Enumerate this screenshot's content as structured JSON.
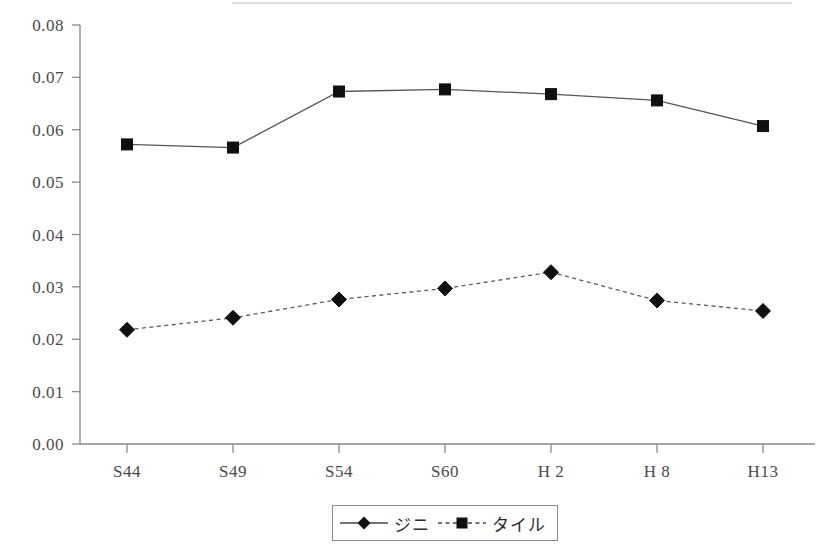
{
  "chart_data": {
    "type": "line",
    "title": "",
    "subtitle": "",
    "xlabel": "",
    "ylabel": "",
    "categories": [
      "S44",
      "S49",
      "S54",
      "S60",
      "H 2",
      "H 8",
      "H13"
    ],
    "series": [
      {
        "name": "ジニ",
        "marker": "diamond",
        "linestyle": "dashed",
        "color": "#101010",
        "values": [
          0.0218,
          0.0241,
          0.0276,
          0.0297,
          0.0328,
          0.0274,
          0.0254
        ]
      },
      {
        "name": "タイル",
        "marker": "square",
        "linestyle": "solid",
        "color": "#101010",
        "values": [
          0.0572,
          0.0566,
          0.0673,
          0.0677,
          0.0668,
          0.0656,
          0.0607
        ]
      }
    ],
    "ylim": [
      0.0,
      0.08
    ],
    "ytick_labels": [
      "0.00",
      "0.01",
      "0.02",
      "0.03",
      "0.04",
      "0.05",
      "0.06",
      "0.07",
      "0.08"
    ],
    "ytick_values": [
      0.0,
      0.01,
      0.02,
      0.03,
      0.04,
      0.05,
      0.06,
      0.07,
      0.08
    ],
    "grid": false,
    "legend_position": "bottom-center",
    "legend_entries": [
      "ジニ",
      "タイル"
    ]
  },
  "legend": {
    "gini_label": "ジニ",
    "theil_label": "タイル"
  }
}
